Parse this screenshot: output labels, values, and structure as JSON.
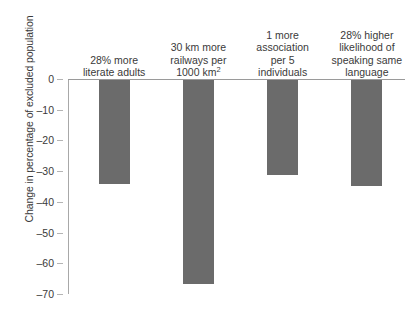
{
  "chart_data": {
    "type": "bar",
    "title": "",
    "subtitle": "",
    "xlabel": "",
    "ylabel": "Change in percentage of excluded population",
    "categories": [
      "28% more literate adults",
      "30 km more railways per 1000 km²",
      "1 more association per 5 individuals",
      "28% higher likelihood of speaking same language"
    ],
    "category_lines": [
      [
        "28% more",
        "literate adults"
      ],
      [
        "30 km more",
        "railways per",
        "1000 km2"
      ],
      [
        "1 more",
        "association",
        "per 5",
        "individuals"
      ],
      [
        "28% higher",
        "likelihood of",
        "speaking same",
        "language"
      ]
    ],
    "values": [
      -34,
      -66.5,
      -31,
      -34.5
    ],
    "ylim": [
      -70,
      0
    ],
    "yticks": [
      0,
      -10,
      -20,
      -30,
      -40,
      -50,
      -60,
      -70
    ],
    "ytick_labels": [
      "0",
      "–10",
      "–20",
      "–30",
      "–40",
      "–50",
      "–60",
      "–70"
    ],
    "grid": false,
    "legend": false,
    "legend_position": "none",
    "bar_color": "#6b6b6b",
    "axis_color": "#a8a8a8",
    "text_color": "#3a3a3a",
    "background_color": "#ffffff",
    "label_position": "above-zero-line",
    "bar_direction": "downward"
  },
  "superscript": {
    "km_exponent": "2"
  },
  "km_label_parts": {
    "line3_base": "1000 km",
    "line3_sup": "2"
  }
}
